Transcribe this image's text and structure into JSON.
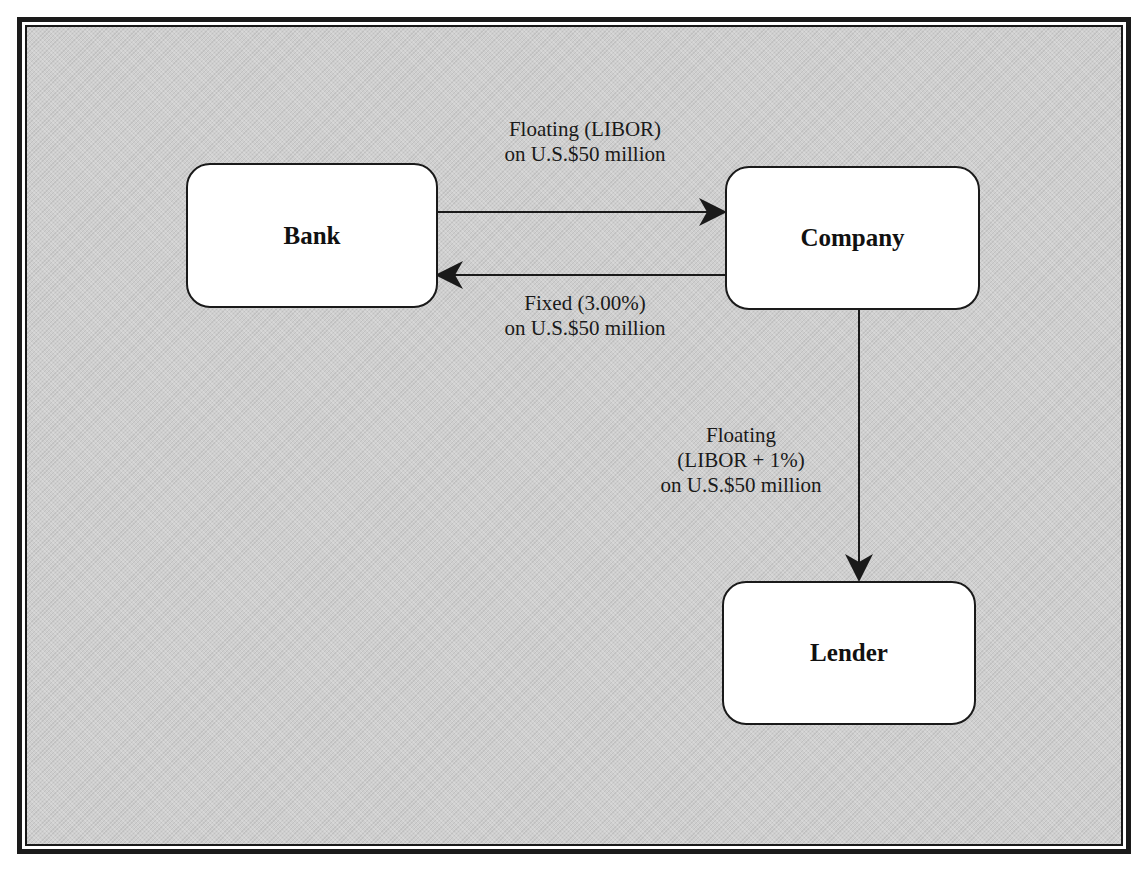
{
  "diagram": {
    "nodes": {
      "bank": {
        "label": "Bank"
      },
      "company": {
        "label": "Company"
      },
      "lender": {
        "label": "Lender"
      }
    },
    "edges": [
      {
        "from": "Bank",
        "to": "Company",
        "line1": "Floating (LIBOR)",
        "line2": "on U.S.$50 million"
      },
      {
        "from": "Company",
        "to": "Bank",
        "line1": "Fixed (3.00%)",
        "line2": "on U.S.$50 million"
      },
      {
        "from": "Company",
        "to": "Lender",
        "line1": "Floating",
        "line2": "(LIBOR + 1%)",
        "line3": "on U.S.$50 million"
      }
    ]
  },
  "colors": {
    "background": "#cfcfcf",
    "node_fill": "#ffffff",
    "stroke": "#1a1a1a"
  }
}
